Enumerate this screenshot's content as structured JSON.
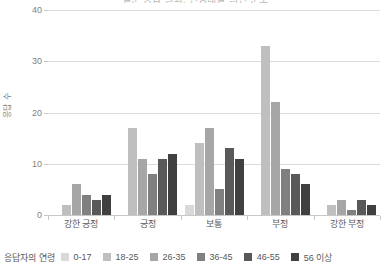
{
  "chart_data": {
    "type": "bar",
    "title": "설문 응답 결과: 연령대별 의견 분포",
    "xlabel": "",
    "ylabel": "응답 수",
    "ylim": [
      0,
      40
    ],
    "yticks": [
      0,
      10,
      20,
      30,
      40
    ],
    "grid": true,
    "legend_position": "bottom",
    "legend_title": "응답자의 연령",
    "categories": [
      "강한 긍정",
      "긍정",
      "보통",
      "부정",
      "강한 부정"
    ],
    "series": [
      {
        "name": "0-17",
        "color": "#d9d9d9",
        "values": [
          0,
          0,
          2,
          0,
          0
        ]
      },
      {
        "name": "18-25",
        "color": "#bfbfbf",
        "values": [
          2,
          17,
          14,
          33,
          2
        ]
      },
      {
        "name": "26-35",
        "color": "#a6a6a6",
        "values": [
          6,
          11,
          17,
          22,
          3
        ]
      },
      {
        "name": "36-45",
        "color": "#808080",
        "values": [
          4,
          8,
          5,
          9,
          1
        ]
      },
      {
        "name": "46-55",
        "color": "#595959",
        "values": [
          3,
          11,
          13,
          8,
          3
        ]
      },
      {
        "name": "56 이상",
        "color": "#404040",
        "values": [
          4,
          12,
          11,
          6,
          2
        ]
      }
    ]
  },
  "axis": {
    "y_title": "응답 수"
  }
}
